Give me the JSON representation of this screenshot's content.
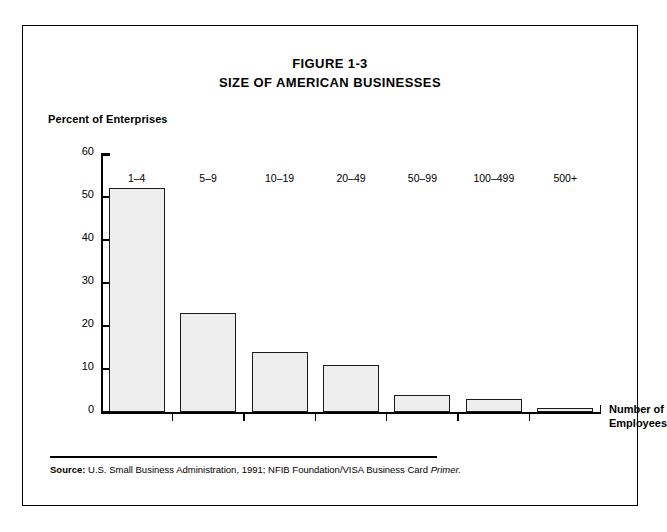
{
  "figure": {
    "number": "FIGURE 1-3",
    "title": "SIZE OF AMERICAN BUSINESSES"
  },
  "source": {
    "label": "Source:",
    "text": " U.S. Small Business Administration, 1991; NFIB Foundation/VISA Business Card ",
    "italic": "Primer."
  },
  "colors": {
    "bar_fill": "#eeeeee",
    "bar_border": "#1a1a1a",
    "axis": "#000000",
    "frame": "#000000",
    "background": "#ffffff"
  },
  "chart_data": {
    "type": "bar",
    "title": "SIZE OF AMERICAN BUSINESSES",
    "subtitle": "FIGURE 1-3",
    "xlabel": "Number of Employees",
    "ylabel": "Percent of Enterprises",
    "categories": [
      "1–4",
      "5–9",
      "10–19",
      "20–49",
      "50–99",
      "100–499",
      "500+"
    ],
    "values": [
      52,
      23,
      14,
      11,
      4,
      3,
      1
    ],
    "ylim": [
      0,
      60
    ],
    "yticks": [
      0,
      10,
      20,
      30,
      40,
      50,
      60
    ],
    "ytick_labels": [
      "0",
      "10",
      "20",
      "30",
      "40",
      "50",
      "60"
    ],
    "grid": false,
    "legend": false
  },
  "axis": {
    "y_title": "Percent of Enterprises",
    "x_title_line1": "Number of",
    "x_title_line2": "Employees"
  }
}
